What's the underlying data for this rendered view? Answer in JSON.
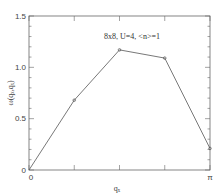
{
  "chart_data": {
    "type": "line",
    "title": "",
    "annotation": "8x8, U=4, <n>=1",
    "xlabel": "qₓ",
    "ylabel": "ω(qₓ,qₓ)",
    "x": [
      0,
      0.7854,
      1.5708,
      2.3562,
      3.1416
    ],
    "x_labels": [
      "0",
      "π/4",
      "π/2",
      "3π/4",
      "π"
    ],
    "xlim": [
      0,
      3.1416
    ],
    "ylim": [
      0,
      1.5
    ],
    "x_tick_labels": [
      "0",
      "π"
    ],
    "y_tick_labels": [
      "0",
      "0.5",
      "1.0",
      "1.5"
    ],
    "series": [
      {
        "name": "ω(qₓ,qₓ)",
        "values": [
          0.0,
          0.68,
          1.17,
          1.09,
          0.21
        ],
        "marker": "circle",
        "color": "#555555"
      }
    ],
    "grid": false,
    "legend": null
  },
  "labels": {
    "annotation": "8x8, U=4, <n>=1",
    "xlabel": "qₓ",
    "ylabel": "ω(qₓ,qₓ)",
    "y0": "0",
    "y05": "0.5",
    "y10": "1.0",
    "y15": "1.5",
    "x0": "0",
    "xpi": "π"
  }
}
